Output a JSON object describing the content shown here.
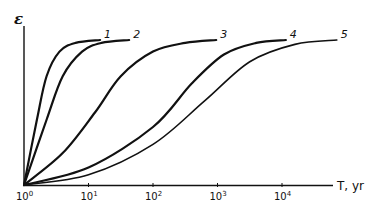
{
  "chart_data": {
    "type": "line",
    "title": "",
    "xlabel": "T, yr",
    "ylabel": "ε",
    "xscale": "log",
    "xlim_log10": [
      0,
      4.85
    ],
    "ylim": [
      0,
      1
    ],
    "grid": false,
    "x_ticks": [
      {
        "log10": 0,
        "base": "10",
        "exp": "0"
      },
      {
        "log10": 1,
        "base": "10",
        "exp": "1"
      },
      {
        "log10": 2,
        "base": "10",
        "exp": "2"
      },
      {
        "log10": 3,
        "base": "10",
        "exp": "3"
      },
      {
        "log10": 4,
        "base": "10",
        "exp": "4"
      }
    ],
    "series": [
      {
        "name": "1",
        "log10_T": [
          0,
          0.2,
          0.35,
          0.55,
          0.8,
          1.18
        ],
        "epsilon": [
          0,
          0.45,
          0.75,
          0.92,
          0.98,
          1.0
        ]
      },
      {
        "name": "2",
        "log10_T": [
          0,
          0.35,
          0.6,
          0.9,
          1.2,
          1.63
        ],
        "epsilon": [
          0,
          0.45,
          0.75,
          0.92,
          0.98,
          1.0
        ]
      },
      {
        "name": "3",
        "log10_T": [
          0,
          0.6,
          1.1,
          1.5,
          2.0,
          2.5,
          2.98
        ],
        "epsilon": [
          0,
          0.22,
          0.5,
          0.75,
          0.92,
          0.98,
          1.0
        ]
      },
      {
        "name": "4",
        "log10_T": [
          0,
          1.0,
          2.0,
          2.6,
          3.1,
          3.6,
          4.06
        ],
        "epsilon": [
          0,
          0.12,
          0.4,
          0.7,
          0.9,
          0.98,
          1.0
        ]
      },
      {
        "name": "5",
        "log10_T": [
          0,
          1.0,
          2.0,
          2.8,
          3.5,
          4.2,
          4.85
        ],
        "epsilon": [
          0,
          0.07,
          0.28,
          0.58,
          0.85,
          0.97,
          1.0
        ]
      }
    ],
    "stroke_weights": [
      "bold",
      "bold",
      "bold",
      "bold",
      "thin"
    ],
    "legend": "inline labels at curve ends"
  }
}
